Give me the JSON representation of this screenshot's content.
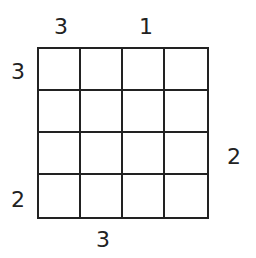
{
  "puzzle": {
    "type": "skyscrapers",
    "size": 4,
    "clues": {
      "top": [
        "3",
        "",
        "1",
        ""
      ],
      "bottom": [
        "",
        "3",
        "",
        ""
      ],
      "left": [
        "3",
        "",
        "",
        "2"
      ],
      "right": [
        "",
        "",
        "2",
        ""
      ]
    },
    "cells": [
      [
        "",
        "",
        "",
        ""
      ],
      [
        "",
        "",
        "",
        ""
      ],
      [
        "",
        "",
        "",
        ""
      ],
      [
        "",
        "",
        "",
        ""
      ]
    ]
  }
}
